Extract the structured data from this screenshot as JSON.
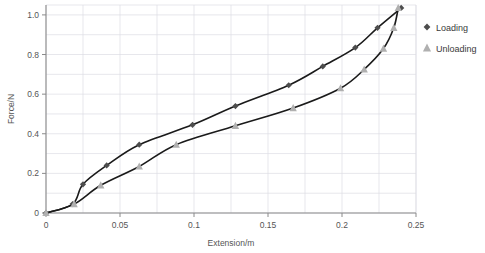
{
  "chart_data": {
    "type": "line",
    "title": "",
    "xlabel": "Extension/m",
    "ylabel": "Force/N",
    "xlim": [
      0,
      0.25
    ],
    "ylim": [
      0,
      1.05
    ],
    "xticks": [
      0,
      0.05,
      0.1,
      0.15,
      0.2,
      0.25
    ],
    "xtick_labels": [
      "0",
      "0.05",
      "0.1",
      "0.15",
      "0.2",
      "0.25"
    ],
    "yticks": [
      0,
      0.2,
      0.4,
      0.6,
      0.8,
      1.0
    ],
    "ytick_labels": [
      "0",
      "0.2",
      "0.4",
      "0.6",
      "0.8",
      "1.0"
    ],
    "grid": true,
    "grid_minor_x": 0.025,
    "grid_minor_y": 0.1,
    "legend_position": "right",
    "series": [
      {
        "name": "Loading",
        "marker": "diamond",
        "color": "#4d4d4d",
        "line_color": "#1a1a1a",
        "points": [
          {
            "x": 0.0,
            "y": 0.0
          },
          {
            "x": 0.018,
            "y": 0.045
          },
          {
            "x": 0.025,
            "y": 0.145
          },
          {
            "x": 0.041,
            "y": 0.24
          },
          {
            "x": 0.063,
            "y": 0.345
          },
          {
            "x": 0.099,
            "y": 0.445
          },
          {
            "x": 0.128,
            "y": 0.54
          },
          {
            "x": 0.164,
            "y": 0.645
          },
          {
            "x": 0.187,
            "y": 0.74
          },
          {
            "x": 0.209,
            "y": 0.835
          },
          {
            "x": 0.224,
            "y": 0.935
          },
          {
            "x": 0.24,
            "y": 1.035
          }
        ]
      },
      {
        "name": "Unloading",
        "marker": "triangle",
        "color": "#b0b0b0",
        "line_color": "#1a1a1a",
        "points": [
          {
            "x": 0.0,
            "y": 0.0
          },
          {
            "x": 0.019,
            "y": 0.045
          },
          {
            "x": 0.037,
            "y": 0.14
          },
          {
            "x": 0.063,
            "y": 0.235
          },
          {
            "x": 0.088,
            "y": 0.345
          },
          {
            "x": 0.128,
            "y": 0.44
          },
          {
            "x": 0.167,
            "y": 0.53
          },
          {
            "x": 0.199,
            "y": 0.63
          },
          {
            "x": 0.215,
            "y": 0.725
          },
          {
            "x": 0.228,
            "y": 0.83
          },
          {
            "x": 0.235,
            "y": 0.935
          },
          {
            "x": 0.238,
            "y": 1.035
          }
        ]
      }
    ]
  },
  "legend": {
    "items": [
      {
        "label": "Loading",
        "marker": "diamond",
        "color": "#4d4d4d"
      },
      {
        "label": "Unloading",
        "marker": "triangle",
        "color": "#b0b0b0"
      }
    ]
  },
  "colors": {
    "loading_marker": "#4d4d4d",
    "unloading_marker": "#b0b0b0",
    "curve": "#141414",
    "grid": "#dcdce4",
    "axis": "#8a8a8a",
    "text": "#555555",
    "background": "#ffffff"
  }
}
